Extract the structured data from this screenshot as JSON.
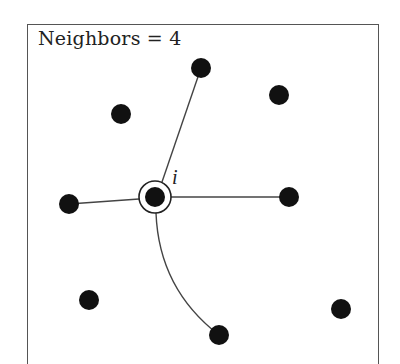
{
  "title": "Neighbors = 4",
  "center_label": "i",
  "colors": {
    "node": "#111111",
    "edge": "#444444",
    "border": "#555555",
    "background": "#ffffff"
  },
  "center_node": {
    "x": 155,
    "y": 197,
    "r": 10,
    "ring_r": 16
  },
  "nodes": [
    {
      "id": "top",
      "x": 201,
      "y": 68,
      "connected": true
    },
    {
      "id": "upper-right",
      "x": 279,
      "y": 95,
      "connected": false
    },
    {
      "id": "upper-left",
      "x": 121,
      "y": 114,
      "connected": false
    },
    {
      "id": "left",
      "x": 69,
      "y": 204,
      "connected": true
    },
    {
      "id": "right",
      "x": 289,
      "y": 197,
      "connected": true
    },
    {
      "id": "lower-left",
      "x": 89,
      "y": 300,
      "connected": false
    },
    {
      "id": "bottom",
      "x": 219,
      "y": 335,
      "connected": true
    },
    {
      "id": "lower-right",
      "x": 341,
      "y": 309,
      "connected": false
    }
  ],
  "neighbor_count": 4
}
